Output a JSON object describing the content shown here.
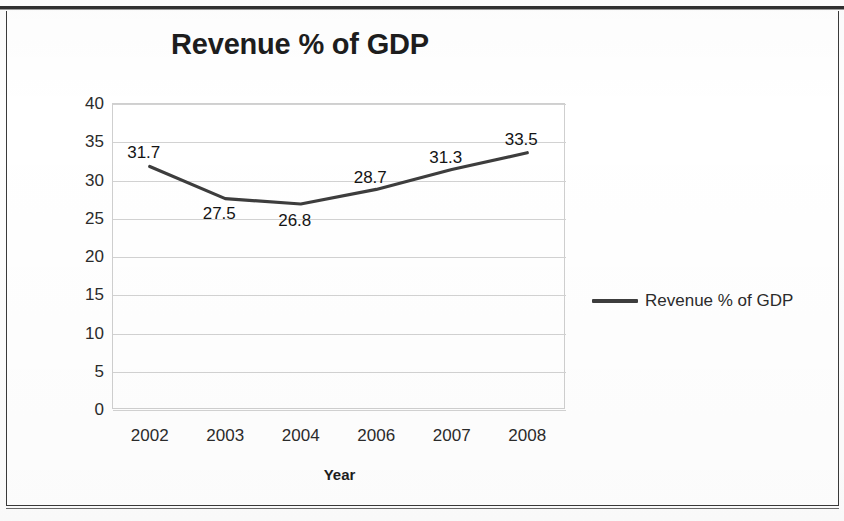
{
  "chart_data": {
    "type": "line",
    "title": "Revenue % of GDP",
    "xlabel": "Year",
    "ylabel": "percent of GDP",
    "categories": [
      "2002",
      "2003",
      "2004",
      "2006",
      "2007",
      "2008"
    ],
    "values": [
      31.7,
      27.5,
      26.8,
      28.7,
      31.3,
      33.5
    ],
    "point_labels": [
      "31.7",
      "27.5",
      "26.8",
      "28.7",
      "31.3",
      "33.5"
    ],
    "series": [
      {
        "name": "Revenue % of GDP",
        "values": [
          31.7,
          27.5,
          26.8,
          28.7,
          31.3,
          33.5
        ],
        "color": "#3d3d3d"
      }
    ],
    "ylim": [
      0,
      40
    ],
    "ytick_step": 5,
    "ytick_labels": [
      "40",
      "35",
      "30",
      "25",
      "20",
      "15",
      "10",
      "5",
      "0"
    ],
    "ytick_values": [
      40,
      35,
      30,
      25,
      20,
      15,
      10,
      5,
      0
    ],
    "grid": true,
    "grid_axis": "y",
    "legend": {
      "position": "right",
      "entries": [
        {
          "label": "Revenue % of GDP",
          "color": "#3d3d3d",
          "marker": "line"
        }
      ]
    }
  }
}
